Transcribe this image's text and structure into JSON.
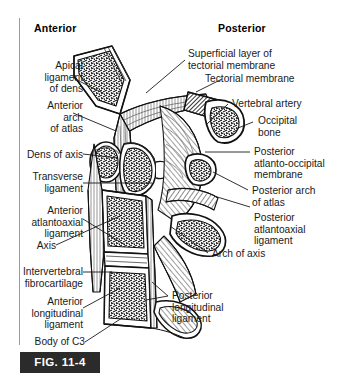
{
  "figure": {
    "caption": "FIG. 11-4",
    "orientation": {
      "anterior": "Anterior",
      "posterior": "Posterior"
    },
    "style": {
      "background": "#ffffff",
      "ink": "#1a1a1a",
      "rule": "#9a9a9a",
      "caption_background": "#2b2b2b",
      "caption_text": "#ffffff"
    }
  },
  "labels": {
    "left": [
      {
        "id": "apical-ligament-of-dens",
        "text": "Apical\nligament\nof dens"
      },
      {
        "id": "anterior-arch-of-atlas",
        "text": "Anterior\narch\nof atlas"
      },
      {
        "id": "dens-of-axis",
        "text": "Dens of axis"
      },
      {
        "id": "transverse-ligament",
        "text": "Transverse\nligament"
      },
      {
        "id": "anterior-atlantoaxial-ligament",
        "text": "Anterior\natlantoaxial\nligament"
      },
      {
        "id": "axis",
        "text": "Axis"
      },
      {
        "id": "intervertebral-fibrocartilage",
        "text": "Intervertebral\nfibrocartilage"
      },
      {
        "id": "anterior-longitudinal-ligament",
        "text": "Anterior\nlongitudinal\nligament"
      },
      {
        "id": "body-of-c3",
        "text": "Body of C3"
      }
    ],
    "right": [
      {
        "id": "superficial-layer-of-tectorial-membrane",
        "text": "Superficial layer of\ntectorial membrane"
      },
      {
        "id": "tectorial-membrane",
        "text": "Tectorial membrane"
      },
      {
        "id": "vertebral-artery",
        "text": "Vertebral artery"
      },
      {
        "id": "occipital-bone",
        "text": "Occipital\nbone"
      },
      {
        "id": "posterior-atlanto-occipital-membrane",
        "text": "Posterior\natlanto-occipital\nmembrane"
      },
      {
        "id": "posterior-arch-of-atlas",
        "text": "Posterior arch\nof atlas"
      },
      {
        "id": "posterior-atlantoaxial-ligament",
        "text": "Posterior\natlantoaxial\nligament"
      },
      {
        "id": "arch-of-axis",
        "text": "Arch of axis"
      }
    ],
    "bottom": [
      {
        "id": "posterior-longitudinal-ligament",
        "text": "Posterior\nlongitudinal\nligament"
      }
    ]
  }
}
